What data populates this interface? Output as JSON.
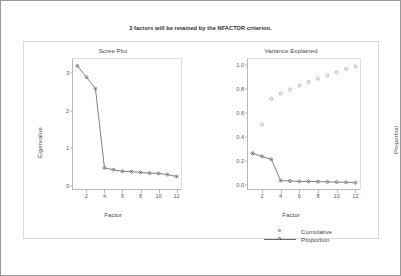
{
  "page": {
    "title": "3 factors will be retained by the NFACTOR criterion."
  },
  "colors": {
    "axis": "#b8b8b8",
    "text": "#4a4a4a",
    "title": "#2b2b2b",
    "series_proportion": "#4a4a4a",
    "series_cumulative": "#8a8a8a",
    "panel_border": "#d9d9d9",
    "outer_border": "#9a9a9a"
  },
  "legend": {
    "items": [
      {
        "label": "Cumulative",
        "marker": "open-circle",
        "has_line": false
      },
      {
        "label": "Proportion",
        "marker": "filled-circle",
        "has_line": true
      }
    ]
  },
  "chart_data": [
    {
      "type": "line",
      "id": "scree-plot",
      "title": "Scree Plot",
      "xlabel": "Factor",
      "ylabel": "Eigenvalue",
      "x": [
        1,
        2,
        3,
        4,
        5,
        6,
        7,
        8,
        9,
        10,
        11,
        12
      ],
      "values": [
        3.19,
        2.89,
        2.58,
        0.47,
        0.42,
        0.38,
        0.37,
        0.35,
        0.33,
        0.32,
        0.29,
        0.24
      ],
      "series": [
        {
          "name": "Eigenvalue",
          "values": [
            3.19,
            2.89,
            2.58,
            0.47,
            0.42,
            0.38,
            0.37,
            0.35,
            0.33,
            0.32,
            0.29,
            0.24
          ],
          "marker": "filled-circle",
          "has_line": true
        }
      ],
      "xlim": [
        0.4,
        12.6
      ],
      "ylim": [
        -0.12,
        3.4
      ],
      "xticks": [
        2,
        4,
        6,
        8,
        10,
        12
      ],
      "yticks": [
        0,
        1,
        2,
        3
      ],
      "ytick_labels": [
        "0",
        "1",
        "2",
        "3"
      ],
      "grid": false,
      "legend_position": "none"
    },
    {
      "type": "line",
      "id": "variance-explained",
      "title": "Variance Explained",
      "xlabel": "Factor",
      "ylabel": "Proportion",
      "x": [
        1,
        2,
        3,
        4,
        5,
        6,
        7,
        8,
        9,
        10,
        11,
        12
      ],
      "series": [
        {
          "name": "Cumulative",
          "values": [
            0.265,
            0.505,
            0.72,
            0.763,
            0.798,
            0.829,
            0.86,
            0.888,
            0.915,
            0.941,
            0.968,
            0.99
          ],
          "marker": "open-circle",
          "has_line": false
        },
        {
          "name": "Proportion",
          "values": [
            0.265,
            0.24,
            0.215,
            0.039,
            0.035,
            0.032,
            0.031,
            0.03,
            0.028,
            0.026,
            0.024,
            0.02
          ],
          "marker": "filled-circle",
          "has_line": true
        }
      ],
      "xlim": [
        0.4,
        12.6
      ],
      "ylim": [
        -0.04,
        1.06
      ],
      "xticks": [
        2,
        4,
        6,
        8,
        10,
        12
      ],
      "yticks": [
        0.0,
        0.2,
        0.4,
        0.6,
        0.8,
        1.0
      ],
      "ytick_labels": [
        "0.0",
        "0.2",
        "0.4",
        "0.6",
        "0.8",
        "1.0"
      ],
      "grid": false,
      "legend_position": "bottom-right"
    }
  ]
}
